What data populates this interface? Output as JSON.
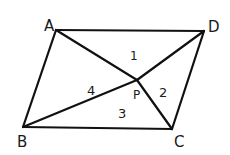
{
  "diagram": {
    "type": "parallelogram-with-diagonals-to-interior-point",
    "stroke_color": "#111111",
    "background": "#ffffff",
    "vertices": {
      "A": {
        "label": "A",
        "x": 56,
        "y": 30
      },
      "B": {
        "label": "B",
        "x": 23,
        "y": 127
      },
      "C": {
        "label": "C",
        "x": 172,
        "y": 129
      },
      "D": {
        "label": "D",
        "x": 204,
        "y": 31
      },
      "P": {
        "label": "P",
        "x": 137,
        "y": 80
      }
    },
    "region_labels": [
      {
        "id": "r1",
        "text": "1",
        "x": 133,
        "y": 59
      },
      {
        "id": "r2",
        "text": "2",
        "x": 163,
        "y": 96
      },
      {
        "id": "r3",
        "text": "3",
        "x": 122,
        "y": 117
      },
      {
        "id": "r4",
        "text": "4",
        "x": 91,
        "y": 94
      }
    ],
    "vertex_labels": [
      {
        "id": "A",
        "text": "A",
        "x": 44,
        "y": 31
      },
      {
        "id": "D",
        "text": "D",
        "x": 210,
        "y": 32
      },
      {
        "id": "B",
        "text": "B",
        "x": 20,
        "y": 146
      },
      {
        "id": "C",
        "text": "C",
        "x": 180,
        "y": 146
      },
      {
        "id": "P",
        "text": "P",
        "x": 136,
        "y": 98
      }
    ]
  }
}
